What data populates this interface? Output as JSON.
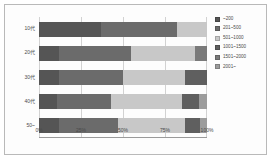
{
  "chart_data": {
    "type": "bar",
    "orientation": "horizontal",
    "stacked": true,
    "normalized": true,
    "title": "",
    "subtitle": "",
    "xlabel": "",
    "ylabel": "",
    "categories": [
      "10代",
      "20代",
      "30代",
      "40代",
      "50~"
    ],
    "xticklabels": [
      "0%",
      "25%",
      "50%",
      "75%",
      "100%"
    ],
    "xtickvalues": [
      0,
      25,
      50,
      75,
      100
    ],
    "xlim": [
      0,
      100
    ],
    "grid": true,
    "legend_position": "right",
    "series": [
      {
        "name": "~200",
        "color": "#555555",
        "values": [
          37,
          12,
          12,
          11,
          12
        ]
      },
      {
        "name": "201~500",
        "color": "#6b6b6b",
        "values": [
          45,
          43,
          38,
          32,
          35
        ]
      },
      {
        "name": "501~1000",
        "color": "#c8c8c8",
        "values": [
          18,
          38,
          37,
          42,
          40
        ]
      },
      {
        "name": "1001~1500",
        "color": "#5f5f5f",
        "values": [
          0,
          0,
          13,
          10,
          9
        ]
      },
      {
        "name": "1501~2000",
        "color": "#7a7a7a",
        "values": [
          0,
          7,
          0,
          0,
          0
        ]
      },
      {
        "name": "2001~",
        "color": "#9c9c9c",
        "values": [
          0,
          0,
          0,
          5,
          4
        ]
      }
    ]
  }
}
